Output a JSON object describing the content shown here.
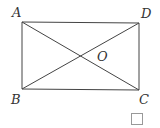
{
  "diagram": {
    "type": "rectangle-with-diagonals",
    "stroke_color": "#444444",
    "points": {
      "A": {
        "label": "A",
        "x": 22,
        "y": 22,
        "lx": 12,
        "ly": 17
      },
      "D": {
        "label": "D",
        "x": 139,
        "y": 23,
        "lx": 141,
        "ly": 18
      },
      "B": {
        "label": "B",
        "x": 22,
        "y": 89,
        "lx": 11,
        "ly": 104
      },
      "C": {
        "label": "C",
        "x": 139,
        "y": 90,
        "lx": 139,
        "ly": 104
      },
      "O": {
        "label": "O",
        "x": 81,
        "y": 56,
        "lx": 97,
        "ly": 61
      }
    },
    "segments": [
      [
        "A",
        "D"
      ],
      [
        "D",
        "C"
      ],
      [
        "C",
        "B"
      ],
      [
        "B",
        "A"
      ],
      [
        "A",
        "C"
      ],
      [
        "B",
        "D"
      ]
    ],
    "answer_box": {
      "x": 131.5,
      "y": 113.5,
      "w": 11,
      "h": 11
    }
  }
}
